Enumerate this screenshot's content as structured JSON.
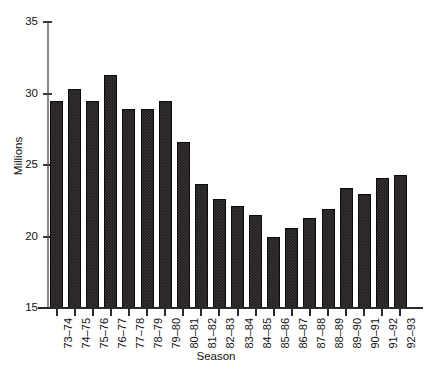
{
  "chart_data": {
    "type": "bar",
    "title": "",
    "xlabel": "Season",
    "ylabel": "Millions",
    "ylim": [
      15,
      35
    ],
    "ytick_labels": [
      "35",
      "30",
      "25",
      "20",
      "15"
    ],
    "yticks": [
      35,
      30,
      25,
      20,
      15
    ],
    "grid": false,
    "legend": null,
    "categories": [
      "73–74",
      "74–75",
      "75–76",
      "76–77",
      "77–78",
      "78–79",
      "79–80",
      "80–81",
      "81–82",
      "82–83",
      "83–84",
      "84–85",
      "85–86",
      "86–87",
      "87–88",
      "88–89",
      "89–90",
      "90–91",
      "91–92",
      "92–93"
    ],
    "values": [
      29.5,
      30.3,
      29.5,
      31.3,
      28.9,
      28.9,
      29.5,
      26.6,
      23.7,
      22.6,
      22.1,
      21.5,
      20.0,
      20.6,
      21.3,
      21.9,
      23.4,
      23.0,
      24.1,
      24.3
    ],
    "bar_color": "#241f1f",
    "axis_color": "#2a2a2a"
  }
}
